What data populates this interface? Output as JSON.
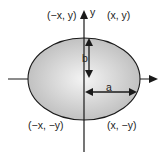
{
  "diagram": {
    "type": "ellipse-on-axes",
    "axes": {
      "y_label": "y"
    },
    "quadrant_labels": {
      "top_left": "(−x, y)",
      "top_right": "(x, y)",
      "bottom_left": "(−x, −y)",
      "bottom_right": "(x, −y)"
    },
    "semi_axes": {
      "vertical_label": "b",
      "horizontal_label": "a"
    },
    "colors": {
      "ellipse_fill_center": "#f2f2f2",
      "ellipse_fill_edge": "#bdbdbd",
      "stroke": "#1a1a1a"
    }
  }
}
